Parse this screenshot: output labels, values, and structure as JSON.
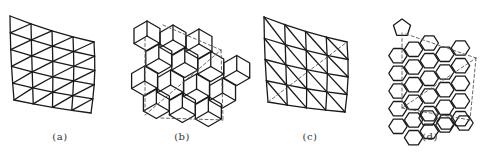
{
  "figure": {
    "background": "#ffffff",
    "line_color": "#1a1a1a",
    "panels": [
      {
        "id": "a",
        "caption": "(a)",
        "description": "Quadrilateral grid subdivided into triangles (diagonals bottom-left to top-right)",
        "type": "tri-grid",
        "corners": {
          "tl": [
            10,
            16
          ],
          "tr": [
            94,
            42
          ],
          "bl": [
            14,
            100
          ],
          "br": [
            91,
            113
          ]
        },
        "cols": 4,
        "rows": 5,
        "diagonal": "slash",
        "bulge": 3,
        "dashed": [],
        "caption_x": 40
      },
      {
        "id": "b",
        "caption": "(b)",
        "description": "Rhombic (cube-like) tiling with dashed reference lines",
        "type": "rhombus",
        "origin": [
          133,
          20
        ],
        "caption_x": 162
      },
      {
        "id": "c",
        "caption": "(c)",
        "description": "Quadrilateral grid subdivided into triangles (diagonals top-left to bottom-right) with dashed diagonal",
        "type": "tri-grid",
        "corners": {
          "tl": [
            264,
            17
          ],
          "tr": [
            347,
            42
          ],
          "bl": [
            268,
            102
          ],
          "br": [
            345,
            112
          ]
        },
        "cols": 4,
        "rows": 4,
        "diagonal": "backslash",
        "bulge": 3,
        "dashed": [
          [
            [
              268,
              102
            ],
            [
              347,
              42
            ]
          ]
        ],
        "caption_x": 290
      },
      {
        "id": "d",
        "caption": "(d)",
        "description": "Hexagonal tiling with pentagonal cell and dashed reference lines",
        "type": "hex",
        "origin": [
          388,
          10
        ],
        "caption_x": 410
      }
    ]
  }
}
